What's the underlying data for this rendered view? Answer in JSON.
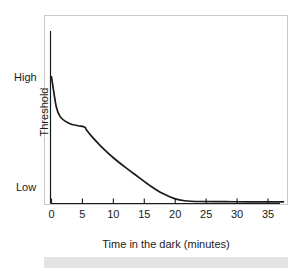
{
  "figure": {
    "background_color": "#ffffff",
    "frame_color": "#c9c9c9",
    "axis_color": "#1a1a1a",
    "curve_color": "#1a1a1a",
    "band_color": "#e3e3e3"
  },
  "chart_data": {
    "type": "line",
    "title": "",
    "subtitle": "",
    "xlabel": "Time in the dark (minutes)",
    "ylabel": "Threshold",
    "xlim": [
      0,
      37.5
    ],
    "ylim": [
      0,
      1
    ],
    "grid": false,
    "legend": "none",
    "x_ticks": [
      0,
      5,
      10,
      15,
      20,
      25,
      30,
      35
    ],
    "x_tick_labels": [
      "0",
      "5",
      "10",
      "15",
      "20",
      "25",
      "30",
      "35"
    ],
    "y_ticks": [
      0.08,
      0.72
    ],
    "y_tick_labels": [
      "Low",
      "High"
    ],
    "annotations": [],
    "series": [
      {
        "name": "Dark adaptation curve",
        "comment": "Cone branch falls steeply then plateaus; rod-cone break near 5.5 min; rod branch falls to absolute threshold by ~21 min",
        "x": [
          0.0,
          0.3,
          0.8,
          1.4,
          2.2,
          3.2,
          4.3,
          5.4,
          5.6,
          6.5,
          8.0,
          10.0,
          12.0,
          14.0,
          16.0,
          18.0,
          20.0,
          21.5,
          24.0,
          28.0,
          32.0,
          35.0,
          37.5
        ],
        "y": [
          0.83,
          0.75,
          0.63,
          0.57,
          0.54,
          0.52,
          0.51,
          0.5,
          0.485,
          0.44,
          0.375,
          0.3,
          0.235,
          0.175,
          0.115,
          0.065,
          0.03,
          0.018,
          0.013,
          0.012,
          0.011,
          0.011,
          0.011
        ]
      }
    ]
  },
  "axes": {
    "y_label_high": "High",
    "y_label_low": "Low",
    "y_title": "Threshold",
    "x_title": "Time in the dark (minutes)"
  }
}
